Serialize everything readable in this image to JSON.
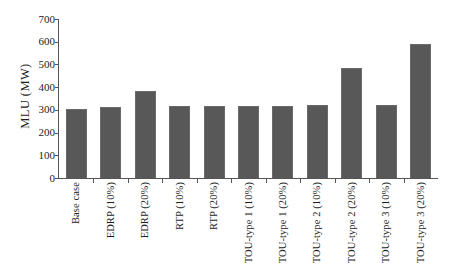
{
  "chart_data": {
    "type": "bar",
    "title": "",
    "subtitle": "",
    "xlabel": "",
    "ylabel": "MLU (MW)",
    "ylim": [
      0,
      700
    ],
    "ytick_step": 100,
    "yticks": [
      700,
      600,
      500,
      400,
      300,
      200,
      100,
      0
    ],
    "grid": false,
    "legend": null,
    "bar_color": "#585858",
    "background_color": "#ffffff",
    "axis_color": "#555555",
    "categories": [
      "Base case",
      "EDRP (10%)",
      "EDRP (20%)",
      "RTP (10%)",
      "RTP (20%)",
      "TOU-type 1 (10%)",
      "TOU-type 1 (20%)",
      "TOU-type 2 (10%)",
      "TOU-type 2 (20%)",
      "TOU-type 3 (10%)",
      "TOU-type 3 (20%)"
    ],
    "values": [
      305,
      312,
      385,
      315,
      318,
      315,
      318,
      320,
      483,
      322,
      590
    ],
    "series": [
      {
        "name": "MLU",
        "values": [
          305,
          312,
          385,
          315,
          318,
          315,
          318,
          320,
          483,
          322,
          590
        ]
      }
    ]
  }
}
